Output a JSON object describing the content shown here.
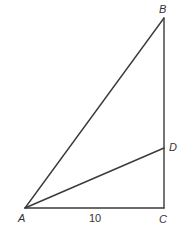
{
  "diagram": {
    "type": "geometry-triangle",
    "points": {
      "A": {
        "label": "A",
        "x": 25,
        "y": 208
      },
      "B": {
        "label": "B",
        "x": 164,
        "y": 18
      },
      "C": {
        "label": "C",
        "x": 164,
        "y": 208
      },
      "D": {
        "label": "D",
        "x": 164,
        "y": 148
      }
    },
    "segments": [
      {
        "from": "A",
        "to": "B"
      },
      {
        "from": "B",
        "to": "C"
      },
      {
        "from": "A",
        "to": "C"
      },
      {
        "from": "A",
        "to": "D"
      }
    ],
    "measurements": {
      "AC": "10"
    },
    "labels": {
      "A": "A",
      "B": "B",
      "C": "C",
      "D": "D",
      "ac_length": "10"
    },
    "colors": {
      "stroke": "#3a3a3a",
      "text": "#333333",
      "background": "#ffffff"
    }
  }
}
